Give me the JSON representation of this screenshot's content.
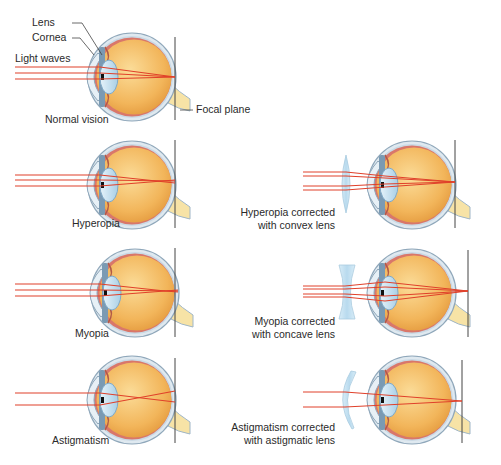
{
  "labels": {
    "lens": "Lens",
    "cornea": "Cornea",
    "light_waves": "Light waves",
    "focal_plane": "Focal plane"
  },
  "panels": [
    {
      "id": "normal",
      "caption": [
        "Normal vision"
      ]
    },
    {
      "id": "hyperopia",
      "caption": [
        "Hyperopia"
      ]
    },
    {
      "id": "hyperopia-corrected",
      "caption": [
        "Hyperopia corrected",
        "with convex lens"
      ]
    },
    {
      "id": "myopia",
      "caption": [
        "Myopia"
      ]
    },
    {
      "id": "myopia-corrected",
      "caption": [
        "Myopia corrected",
        "with concave lens"
      ]
    },
    {
      "id": "astigmatism",
      "caption": [
        "Astigmatism"
      ]
    },
    {
      "id": "astigmatism-corrected",
      "caption": [
        "Astigmatism corrected",
        "with astigmatic lens"
      ]
    }
  ],
  "colors": {
    "ray": "#e0402a",
    "eyeball": "#f2b55a",
    "sclera": "#9fb6c8",
    "lens": "#cfe6f3",
    "muscle": "#d9776a",
    "nerve": "#f7e3a6"
  }
}
